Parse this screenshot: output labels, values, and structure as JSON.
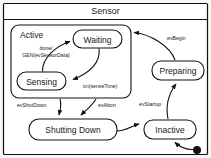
{
  "diagram": {
    "kind": "uml-state-machine",
    "title": "Sensor",
    "states": [
      {
        "id": "active",
        "label": "Active",
        "type": "composite"
      },
      {
        "id": "waiting",
        "label": "Waiting",
        "type": "simple"
      },
      {
        "id": "sensing",
        "label": "Sensing",
        "type": "simple"
      },
      {
        "id": "preparing",
        "label": "Preparing",
        "type": "simple"
      },
      {
        "id": "inactive",
        "label": "Inactive",
        "type": "simple"
      },
      {
        "id": "shutting_down",
        "label": "Shutting Down",
        "type": "simple"
      }
    ],
    "transitions": [
      {
        "id": "t1",
        "from": "waiting",
        "to": "sensing",
        "label": "tm(senseTime)"
      },
      {
        "id": "t2",
        "from": "sensing",
        "to": "waiting",
        "label_line1": "done/",
        "label_line2": "GEN(evSensorData)"
      },
      {
        "id": "t3",
        "from": "preparing",
        "to": "active",
        "label": "evBegin"
      },
      {
        "id": "t4",
        "from": "inactive",
        "to": "preparing",
        "label": "evStartup"
      },
      {
        "id": "t5",
        "from": "active",
        "to": "shutting_down",
        "label": "evShutDown"
      },
      {
        "id": "t6",
        "from": "active",
        "to": "shutting_down",
        "label": "evAbort"
      },
      {
        "id": "t7",
        "from": "shutting_down",
        "to": "inactive",
        "label": ""
      },
      {
        "id": "t8",
        "from": "initial",
        "to": "inactive",
        "label": ""
      }
    ],
    "initial_pseudostate": {
      "id": "initial",
      "label": "initial-state"
    },
    "colors": {
      "background": "#f7f7f5",
      "shape_fill": "#ffffff",
      "stroke": "#111111",
      "text": "#1a1a1a"
    }
  }
}
